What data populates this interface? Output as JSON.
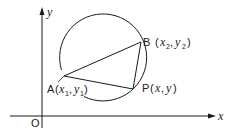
{
  "diagram": {
    "type": "geometry",
    "axes": {
      "x_label": "x",
      "y_label": "y",
      "origin_label": "O"
    },
    "points": [
      {
        "id": "A",
        "name": "A",
        "coords": [
          "x",
          "1",
          "y",
          "1"
        ],
        "label": "A(x1, y1)"
      },
      {
        "id": "B",
        "name": "B",
        "coords": [
          "x",
          "2",
          "y",
          "2"
        ],
        "label": "B (x2, y2)"
      },
      {
        "id": "P",
        "name": "P",
        "coords": [
          "x",
          "",
          "y",
          ""
        ],
        "label": "P(x, y)"
      }
    ],
    "shapes": [
      "circle through A, B, P",
      "triangle ABP"
    ],
    "colors": {
      "stroke": "#1a1a1a",
      "background": "#ffffff"
    }
  }
}
